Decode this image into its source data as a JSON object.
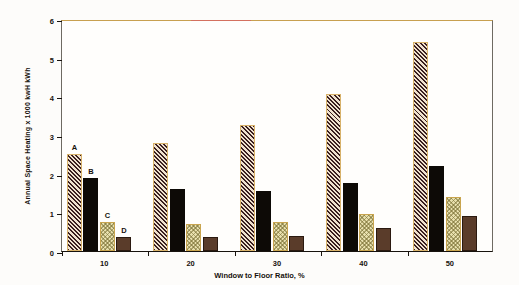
{
  "chart_data": {
    "type": "bar",
    "title": "",
    "xlabel": "Window to Floor Ratio, %",
    "ylabel": "Annual Space Heating x 1000 kwH    kWh",
    "categories": [
      "10",
      "20",
      "30",
      "40",
      "50"
    ],
    "xlim": [
      0,
      5
    ],
    "ylim": [
      0,
      6
    ],
    "ytick_labels": [
      "0",
      "1",
      "2",
      "3",
      "4",
      "5",
      "6"
    ],
    "ytick_values": [
      0,
      1,
      2,
      3,
      4,
      5,
      6
    ],
    "grid": false,
    "legend_position": "in-plot-bar-annotations",
    "series": [
      {
        "name": "A",
        "label": "A",
        "pattern": "diagonal-hatch-dark",
        "color": "#3a1f20",
        "values": [
          2.5,
          2.8,
          3.25,
          4.05,
          5.4
        ]
      },
      {
        "name": "B",
        "label": "B",
        "pattern": "solid-black",
        "color": "#0d0a06",
        "values": [
          1.9,
          1.6,
          1.55,
          1.75,
          2.2
        ]
      },
      {
        "name": "C",
        "label": "C",
        "pattern": "checkerboard-light",
        "color": "#e8e0ae",
        "values": [
          0.75,
          0.7,
          0.75,
          0.95,
          1.4
        ]
      },
      {
        "name": "D",
        "label": "D",
        "pattern": "solid-brown",
        "color": "#5a3c2a",
        "values": [
          0.35,
          0.35,
          0.4,
          0.6,
          0.9
        ]
      }
    ],
    "bar_annotations": [
      {
        "label": "A",
        "group": 0,
        "series": 0
      },
      {
        "label": "B",
        "group": 0,
        "series": 1
      },
      {
        "label": "C",
        "group": 0,
        "series": 2
      },
      {
        "label": "D",
        "group": 0,
        "series": 3
      }
    ]
  },
  "axis": {
    "y_title": "Annual Space Heating x 1000 kwH    kWh",
    "x_title": "Window to Floor Ratio, %"
  },
  "colors": {
    "frame_left_right": "#6e6a62",
    "frame_top": "#c8a050",
    "frame_bottom": "#17120d",
    "top_accent": "#d4705f",
    "text": "#17120d",
    "background": "#fdfcfa"
  }
}
